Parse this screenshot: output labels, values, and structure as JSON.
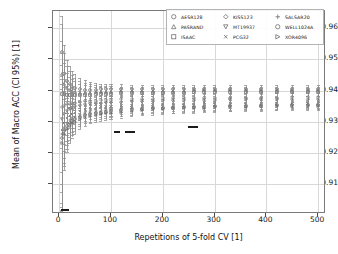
{
  "chart_data": {
    "type": "line",
    "title": "",
    "xlabel": "Repetitions of 5-fold CV [1]",
    "ylabel": "Mean of Macro ACC (CI 95%) [1]",
    "xlim": [
      -12,
      515
    ],
    "ylim": [
      0.9005,
      0.9655
    ],
    "xticks": [
      0,
      100,
      200,
      300,
      400,
      500
    ],
    "yticks": [
      0.91,
      0.92,
      0.93,
      0.94,
      0.95,
      0.96
    ],
    "xtick_labels": [
      "0",
      "100",
      "200",
      "300",
      "400",
      "500"
    ],
    "ytick_labels": [
      "0.91",
      "0.92",
      "0.93",
      "0.94",
      "0.95",
      "0.96"
    ],
    "grid": true,
    "legend_position": "upper right",
    "legend_columns": 3,
    "x": [
      5,
      10,
      15,
      20,
      25,
      30,
      40,
      50,
      60,
      70,
      80,
      90,
      100,
      120,
      140,
      160,
      180,
      200,
      220,
      240,
      260,
      280,
      300,
      330,
      360,
      390,
      420,
      450,
      480,
      500
    ],
    "series": [
      {
        "name": "AESR128",
        "marker": "circle",
        "values": [
          0.9525,
          0.9455,
          0.943,
          0.942,
          0.9412,
          0.9408,
          0.9404,
          0.9402,
          0.9402,
          0.9403,
          0.9404,
          0.9404,
          0.9404,
          0.9405,
          0.9405,
          0.9405,
          0.9405,
          0.9406,
          0.9406,
          0.9406,
          0.9406,
          0.9406,
          0.9406,
          0.9406,
          0.9407,
          0.9407,
          0.9407,
          0.9407,
          0.9407,
          0.9407
        ],
        "ci_low": [
          0.9015,
          0.9275,
          0.933,
          0.9348,
          0.9358,
          0.9364,
          0.937,
          0.9374,
          0.9377,
          0.938,
          0.9382,
          0.9383,
          0.9384,
          0.9386,
          0.9387,
          0.9388,
          0.9389,
          0.939,
          0.9391,
          0.9392,
          0.9392,
          0.9393,
          0.9393,
          0.9394,
          0.9394,
          0.9395,
          0.9395,
          0.9396,
          0.9396,
          0.9396
        ],
        "ci_high": [
          0.964,
          0.9545,
          0.9498,
          0.9478,
          0.9464,
          0.9455,
          0.9442,
          0.9433,
          0.9428,
          0.9425,
          0.9423,
          0.9422,
          0.9421,
          0.942,
          0.9419,
          0.9418,
          0.9418,
          0.9418,
          0.9418,
          0.9418,
          0.9418,
          0.9418,
          0.9418,
          0.9418,
          0.9418,
          0.9418,
          0.9418,
          0.9418,
          0.9418,
          0.9418
        ]
      },
      {
        "name": "PASRAND",
        "marker": "triangle-up",
        "values": [
          0.9455,
          0.942,
          0.9408,
          0.9402,
          0.9398,
          0.9396,
          0.9394,
          0.9394,
          0.9394,
          0.9395,
          0.9396,
          0.9396,
          0.9397,
          0.9398,
          0.9398,
          0.9399,
          0.9399,
          0.94,
          0.94,
          0.94,
          0.9401,
          0.9401,
          0.9401,
          0.9401,
          0.9402,
          0.9402,
          0.9402,
          0.9402,
          0.9402,
          0.9402
        ],
        "ci_low": [
          0.9215,
          0.93,
          0.933,
          0.9344,
          0.9352,
          0.9358,
          0.9364,
          0.9368,
          0.9371,
          0.9373,
          0.9375,
          0.9377,
          0.9378,
          0.938,
          0.9382,
          0.9383,
          0.9384,
          0.9385,
          0.9386,
          0.9386,
          0.9387,
          0.9388,
          0.9388,
          0.9389,
          0.939,
          0.939,
          0.9391,
          0.9391,
          0.9392,
          0.9392
        ],
        "ci_high": [
          0.9615,
          0.952,
          0.948,
          0.9462,
          0.945,
          0.9442,
          0.943,
          0.9424,
          0.942,
          0.9418,
          0.9416,
          0.9415,
          0.9414,
          0.9413,
          0.9412,
          0.9412,
          0.9412,
          0.9412,
          0.9412,
          0.9412,
          0.9412,
          0.9412,
          0.9412,
          0.9412,
          0.9412,
          0.9412,
          0.9412,
          0.9412,
          0.9412,
          0.9412
        ]
      },
      {
        "name": "ISAAC",
        "marker": "square",
        "values": [
          0.939,
          0.9388,
          0.9386,
          0.9385,
          0.9385,
          0.9385,
          0.9386,
          0.9386,
          0.9387,
          0.9388,
          0.9389,
          0.9389,
          0.939,
          0.9391,
          0.9392,
          0.9392,
          0.9393,
          0.9393,
          0.9394,
          0.9394,
          0.9395,
          0.9395,
          0.9395,
          0.9396,
          0.9396,
          0.9396,
          0.9397,
          0.9397,
          0.9397,
          0.9397
        ],
        "ci_low": [
          0.914,
          0.9262,
          0.93,
          0.932,
          0.933,
          0.9338,
          0.9346,
          0.9352,
          0.9356,
          0.9359,
          0.9362,
          0.9364,
          0.9365,
          0.9368,
          0.937,
          0.9372,
          0.9373,
          0.9374,
          0.9375,
          0.9376,
          0.9377,
          0.9378,
          0.9378,
          0.9379,
          0.938,
          0.9381,
          0.9381,
          0.9382,
          0.9382,
          0.9383
        ],
        "ci_high": [
          0.956,
          0.949,
          0.9458,
          0.9444,
          0.9436,
          0.943,
          0.9422,
          0.9418,
          0.9415,
          0.9413,
          0.9412,
          0.9411,
          0.941,
          0.941,
          0.9409,
          0.9409,
          0.9409,
          0.9409,
          0.9409,
          0.9409,
          0.9409,
          0.9409,
          0.9409,
          0.9409,
          0.9409,
          0.9409,
          0.9409,
          0.9409,
          0.9409,
          0.9409
        ]
      },
      {
        "name": "KISS123",
        "marker": "diamond",
        "values": [
          0.9348,
          0.9352,
          0.9356,
          0.9358,
          0.936,
          0.9362,
          0.9364,
          0.9366,
          0.9367,
          0.9368,
          0.9369,
          0.937,
          0.9371,
          0.9372,
          0.9373,
          0.9374,
          0.9374,
          0.9375,
          0.9375,
          0.9376,
          0.9376,
          0.9377,
          0.9377,
          0.9377,
          0.9378,
          0.9378,
          0.9378,
          0.9379,
          0.9379,
          0.9379
        ],
        "ci_low": [
          0.91,
          0.923,
          0.9276,
          0.9298,
          0.931,
          0.9318,
          0.9328,
          0.9334,
          0.9338,
          0.9341,
          0.9344,
          0.9346,
          0.9348,
          0.935,
          0.9352,
          0.9354,
          0.9355,
          0.9356,
          0.9357,
          0.9358,
          0.9359,
          0.936,
          0.936,
          0.9361,
          0.9362,
          0.9363,
          0.9363,
          0.9364,
          0.9364,
          0.9365
        ],
        "ci_high": [
          0.952,
          0.946,
          0.9432,
          0.942,
          0.9412,
          0.9406,
          0.94,
          0.9396,
          0.9394,
          0.9393,
          0.9392,
          0.9392,
          0.9392,
          0.9392,
          0.9392,
          0.9392,
          0.9392,
          0.9392,
          0.9392,
          0.9392,
          0.9392,
          0.9392,
          0.9392,
          0.9392,
          0.9392,
          0.9392,
          0.9392,
          0.9392,
          0.9392,
          0.9392
        ]
      },
      {
        "name": "MT19937",
        "marker": "triangle-down",
        "values": [
          0.931,
          0.9325,
          0.9334,
          0.934,
          0.9344,
          0.9347,
          0.9351,
          0.9354,
          0.9356,
          0.9357,
          0.9358,
          0.9359,
          0.936,
          0.9362,
          0.9363,
          0.9364,
          0.9365,
          0.9366,
          0.9366,
          0.9367,
          0.9367,
          0.9368,
          0.9368,
          0.9369,
          0.9369,
          0.937,
          0.937,
          0.937,
          0.9371,
          0.9371
        ],
        "ci_low": [
          0.9075,
          0.9208,
          0.9258,
          0.9282,
          0.9296,
          0.9306,
          0.9318,
          0.9325,
          0.933,
          0.9333,
          0.9336,
          0.9338,
          0.934,
          0.9343,
          0.9345,
          0.9347,
          0.9348,
          0.9349,
          0.935,
          0.9351,
          0.9352,
          0.9353,
          0.9353,
          0.9354,
          0.9355,
          0.9356,
          0.9356,
          0.9357,
          0.9357,
          0.9358
        ],
        "ci_high": [
          0.9482,
          0.9436,
          0.9414,
          0.9404,
          0.9396,
          0.9392,
          0.9386,
          0.9384,
          0.9383,
          0.9383,
          0.9383,
          0.9383,
          0.9383,
          0.9383,
          0.9383,
          0.9383,
          0.9383,
          0.9383,
          0.9383,
          0.9383,
          0.9383,
          0.9383,
          0.9383,
          0.9383,
          0.9383,
          0.9383,
          0.9383,
          0.9383,
          0.9383,
          0.9383
        ]
      },
      {
        "name": "PCG32",
        "marker": "cross",
        "values": [
          0.9275,
          0.9298,
          0.9312,
          0.932,
          0.9326,
          0.933,
          0.9336,
          0.934,
          0.9343,
          0.9345,
          0.9347,
          0.9348,
          0.9349,
          0.9351,
          0.9353,
          0.9354,
          0.9355,
          0.9356,
          0.9357,
          0.9358,
          0.9358,
          0.9359,
          0.9359,
          0.936,
          0.9361,
          0.9361,
          0.9362,
          0.9362,
          0.9362,
          0.9363
        ],
        "ci_low": [
          0.904,
          0.9186,
          0.924,
          0.9266,
          0.9282,
          0.9292,
          0.9306,
          0.9314,
          0.9319,
          0.9323,
          0.9326,
          0.9328,
          0.933,
          0.9333,
          0.9336,
          0.9338,
          0.9339,
          0.9341,
          0.9342,
          0.9343,
          0.9344,
          0.9345,
          0.9345,
          0.9346,
          0.9347,
          0.9348,
          0.9348,
          0.9349,
          0.9349,
          0.935
        ],
        "ci_high": [
          0.9448,
          0.9412,
          0.9392,
          0.9382,
          0.9376,
          0.9372,
          0.9368,
          0.9366,
          0.9365,
          0.9365,
          0.9365,
          0.9365,
          0.9365,
          0.9366,
          0.9366,
          0.9366,
          0.9367,
          0.9367,
          0.9367,
          0.9368,
          0.9368,
          0.9368,
          0.9368,
          0.9369,
          0.9369,
          0.9369,
          0.937,
          0.937,
          0.937,
          0.937
        ]
      },
      {
        "name": "SALSAR20",
        "marker": "plus",
        "values": [
          0.9262,
          0.9282,
          0.9296,
          0.9305,
          0.9311,
          0.9316,
          0.9323,
          0.9328,
          0.9331,
          0.9334,
          0.9336,
          0.9338,
          0.9339,
          0.9342,
          0.9344,
          0.9346,
          0.9347,
          0.9348,
          0.9349,
          0.935,
          0.9351,
          0.9352,
          0.9352,
          0.9353,
          0.9354,
          0.9355,
          0.9355,
          0.9356,
          0.9356,
          0.9357
        ],
        "ci_low": [
          0.9028,
          0.917,
          0.9226,
          0.9252,
          0.9268,
          0.928,
          0.9294,
          0.9303,
          0.9308,
          0.9312,
          0.9316,
          0.9318,
          0.932,
          0.9324,
          0.9327,
          0.9329,
          0.9331,
          0.9332,
          0.9334,
          0.9335,
          0.9336,
          0.9337,
          0.9338,
          0.9339,
          0.934,
          0.9341,
          0.9342,
          0.9343,
          0.9343,
          0.9344
        ],
        "ci_high": [
          0.9436,
          0.9398,
          0.9378,
          0.9368,
          0.9362,
          0.9358,
          0.9354,
          0.9353,
          0.9353,
          0.9353,
          0.9354,
          0.9354,
          0.9355,
          0.9356,
          0.9357,
          0.9358,
          0.9359,
          0.936,
          0.936,
          0.9361,
          0.9362,
          0.9362,
          0.9363,
          0.9364,
          0.9364,
          0.9365,
          0.9365,
          0.9366,
          0.9366,
          0.9366
        ]
      },
      {
        "name": "WELL1024A",
        "marker": "circle-open",
        "values": [
          0.9248,
          0.9272,
          0.9286,
          0.9296,
          0.9303,
          0.9308,
          0.9316,
          0.9321,
          0.9325,
          0.9328,
          0.933,
          0.9332,
          0.9334,
          0.9337,
          0.934,
          0.9342,
          0.9343,
          0.9345,
          0.9346,
          0.9347,
          0.9348,
          0.9349,
          0.935,
          0.9351,
          0.9352,
          0.9352,
          0.9353,
          0.9354,
          0.9354,
          0.9355
        ],
        "ci_low": [
          0.9018,
          0.9158,
          0.9214,
          0.9242,
          0.9258,
          0.927,
          0.9286,
          0.9295,
          0.9301,
          0.9306,
          0.931,
          0.9312,
          0.9315,
          0.9319,
          0.9322,
          0.9325,
          0.9327,
          0.9329,
          0.933,
          0.9332,
          0.9333,
          0.9334,
          0.9335,
          0.9336,
          0.9337,
          0.9338,
          0.9339,
          0.934,
          0.9341,
          0.9341
        ],
        "ci_high": [
          0.942,
          0.9386,
          0.9366,
          0.9356,
          0.935,
          0.9346,
          0.9344,
          0.9344,
          0.9345,
          0.9346,
          0.9347,
          0.9348,
          0.9349,
          0.9351,
          0.9352,
          0.9353,
          0.9354,
          0.9355,
          0.9356,
          0.9357,
          0.9358,
          0.9359,
          0.936,
          0.9361,
          0.9362,
          0.9363,
          0.9363,
          0.9364,
          0.9365,
          0.9365
        ]
      },
      {
        "name": "XOR4096",
        "marker": "triangle-right",
        "values": [
          0.9232,
          0.926,
          0.9276,
          0.9288,
          0.9295,
          0.9301,
          0.931,
          0.9316,
          0.932,
          0.9323,
          0.9326,
          0.9328,
          0.933,
          0.9333,
          0.9336,
          0.9338,
          0.934,
          0.9342,
          0.9343,
          0.9344,
          0.9345,
          0.9346,
          0.9347,
          0.9348,
          0.9349,
          0.935,
          0.9351,
          0.9351,
          0.9352,
          0.9352
        ],
        "ci_low": [
          0.9008,
          0.9146,
          0.9204,
          0.9232,
          0.925,
          0.9262,
          0.9278,
          0.9288,
          0.9295,
          0.93,
          0.9304,
          0.9307,
          0.931,
          0.9314,
          0.9318,
          0.9321,
          0.9323,
          0.9325,
          0.9327,
          0.9329,
          0.933,
          0.9331,
          0.9332,
          0.9334,
          0.9335,
          0.9336,
          0.9337,
          0.9338,
          0.9339,
          0.9339
        ],
        "ci_high": [
          0.9404,
          0.9374,
          0.9356,
          0.9346,
          0.934,
          0.9338,
          0.9338,
          0.9339,
          0.934,
          0.9342,
          0.9344,
          0.9345,
          0.9346,
          0.9348,
          0.935,
          0.9352,
          0.9353,
          0.9354,
          0.9355,
          0.9356,
          0.9357,
          0.9358,
          0.9359,
          0.936,
          0.9361,
          0.9362,
          0.9362,
          0.9363,
          0.9364,
          0.9364
        ]
      }
    ],
    "highlight_segments": [
      {
        "x_start": 4,
        "x_end": 18,
        "y": 0.902
      },
      {
        "x_start": 106,
        "x_end": 118,
        "y": 0.927
      },
      {
        "x_start": 126,
        "x_end": 146,
        "y": 0.927
      },
      {
        "x_start": 248,
        "x_end": 268,
        "y": 0.9288
      }
    ]
  },
  "legend": {
    "entries": [
      {
        "label": "AESR128",
        "marker": "circle"
      },
      {
        "label": "KISS123",
        "marker": "diamond"
      },
      {
        "label": "SALSAR20",
        "marker": "plus"
      },
      {
        "label": "PASRAND",
        "marker": "triangle-up"
      },
      {
        "label": "MT19937",
        "marker": "triangle-down"
      },
      {
        "label": "WELL1024A",
        "marker": "circle-open"
      },
      {
        "label": "ISAAC",
        "marker": "square"
      },
      {
        "label": "PCG32",
        "marker": "cross"
      },
      {
        "label": "XOR4096",
        "marker": "triangle-right"
      }
    ]
  },
  "colors": {
    "background": "#ffffff",
    "frame": "#7a7a7a",
    "grid": "#d8d8d8",
    "series": "#8e8e8e",
    "marker": "#6f6f6f",
    "highlight": "#1c1c1c",
    "text": "#111111"
  }
}
